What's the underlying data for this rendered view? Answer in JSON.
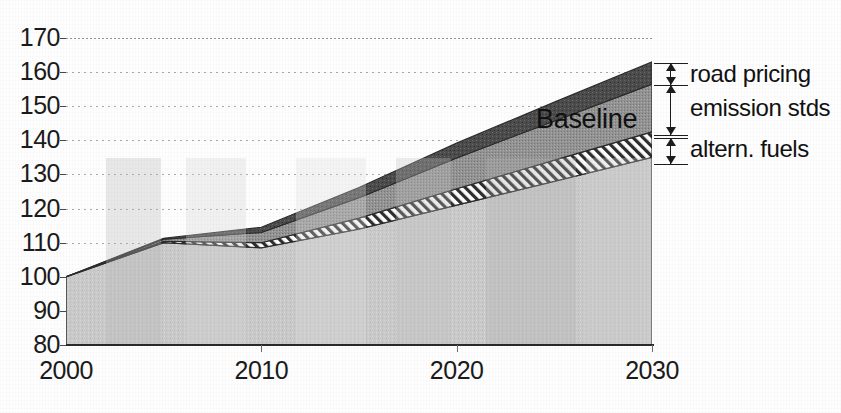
{
  "chart_data": {
    "type": "area",
    "title": "",
    "subtitle": "",
    "xlabel": "",
    "ylabel": "",
    "xlim": [
      2000,
      2030
    ],
    "ylim": [
      80,
      170
    ],
    "grid": true,
    "legend_position": "right-annotations",
    "x_ticks": [
      "2000",
      "2010",
      "2020",
      "2030"
    ],
    "x_tick_values": [
      2000,
      2010,
      2020,
      2030
    ],
    "y_ticks": [
      "80",
      "90",
      "100",
      "110",
      "120",
      "130",
      "140",
      "150",
      "160",
      "170"
    ],
    "y_tick_values": [
      80,
      90,
      100,
      110,
      120,
      130,
      140,
      150,
      160,
      170
    ],
    "x": [
      2000,
      2005,
      2010,
      2015,
      2020,
      2025,
      2030
    ],
    "annotations": [
      {
        "text": "Baseline",
        "x": 2019,
        "y": 158
      }
    ],
    "series": [
      {
        "name": "policy case",
        "label": "",
        "fill": "#c9c9c9",
        "pattern": "solid-light",
        "values": [
          100,
          110,
          108.5,
          114,
          121,
          128,
          135
        ]
      },
      {
        "name": "altern. fuels",
        "label": "altern. fuels",
        "fill": "#ffffff",
        "pattern": "diagonal-hatch",
        "values": [
          0,
          0.4,
          1.5,
          3.2,
          4.8,
          6.2,
          7.5
        ]
      },
      {
        "name": "emission stds",
        "label": "emission stds",
        "fill": "#8f8f8f",
        "pattern": "solid-medium",
        "values": [
          0,
          0.6,
          3.0,
          6.0,
          9.0,
          11.5,
          14.0
        ]
      },
      {
        "name": "road pricing",
        "label": "road pricing",
        "fill": "#4a4a4a",
        "pattern": "solid-dark",
        "values": [
          0,
          0.3,
          1.5,
          3.0,
          4.4,
          5.5,
          6.5
        ]
      }
    ],
    "baseline_total": [
      100,
      111.3,
      114.5,
      126.2,
      139.2,
      151.2,
      163.0
    ],
    "band_tops_2030": {
      "policy_case": 135,
      "altern_fuels": 142.5,
      "emission_stds": 156.5,
      "road_pricing": 163
    },
    "colors": {
      "road_pricing": "#4a4a4a",
      "emission_stds": "#8f8f8f",
      "altern_fuels": "#ffffff",
      "policy_case": "#c9c9c9",
      "axis": "#1b1b1b",
      "gridline": "#9a9a9a"
    }
  },
  "annotations_panel": {
    "items": [
      {
        "label": "road pricing"
      },
      {
        "label": "emission stds"
      },
      {
        "label": "altern. fuels"
      }
    ]
  },
  "on_chart": {
    "baseline_label": "Baseline"
  }
}
